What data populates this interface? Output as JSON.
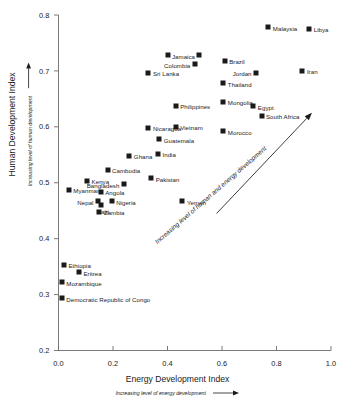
{
  "chart_data": {
    "type": "scatter",
    "title": "",
    "xlabel": "Energy Development Index",
    "xlabel_sub": "Increasing level of energy development",
    "ylabel": "Human Development Index",
    "ylabel_sub": "Increasing level of human development",
    "xlim": [
      0.0,
      1.0
    ],
    "ylim": [
      0.2,
      0.8
    ],
    "xticks": [
      "0.0",
      "0.2",
      "0.4",
      "0.6",
      "0.8",
      "1.0"
    ],
    "xtick_values": [
      0.0,
      0.2,
      0.4,
      0.6,
      0.8,
      1.0
    ],
    "yticks": [
      "0.2",
      "0.3",
      "0.4",
      "0.5",
      "0.6",
      "0.7",
      "0.8"
    ],
    "ytick_values": [
      0.2,
      0.3,
      0.4,
      0.5,
      0.6,
      0.7,
      0.8
    ],
    "grid": false,
    "legend": null,
    "marker_color": "#1a1a1a",
    "marker_shape": "square",
    "annotation": {
      "text": "Increasing level of human and energy development",
      "arrow": true,
      "arrow_from": [
        0.58,
        0.445
      ],
      "arrow_to": [
        0.93,
        0.625
      ]
    },
    "points": [
      {
        "label": "Libya",
        "x": 0.92,
        "y": 0.775,
        "label_side": "right"
      },
      {
        "label": "Malaysia",
        "x": 0.77,
        "y": 0.778,
        "label_side": "right"
      },
      {
        "label": "Jamaica",
        "x": 0.4,
        "y": 0.728,
        "label_side": "right"
      },
      {
        "label": "",
        "x": 0.515,
        "y": 0.728,
        "label_side": "none"
      },
      {
        "label": "Brazil",
        "x": 0.61,
        "y": 0.718,
        "label_side": "right"
      },
      {
        "label": "Colombia",
        "x": 0.5,
        "y": 0.712,
        "label_side": "left"
      },
      {
        "label": "Iran",
        "x": 0.895,
        "y": 0.7,
        "label_side": "right"
      },
      {
        "label": "Jordan",
        "x": 0.725,
        "y": 0.697,
        "label_side": "left"
      },
      {
        "label": "Sri Lanka",
        "x": 0.33,
        "y": 0.697,
        "label_side": "right"
      },
      {
        "label": "Thailand",
        "x": 0.605,
        "y": 0.678,
        "label_side": "right"
      },
      {
        "label": "Mongolia",
        "x": 0.605,
        "y": 0.645,
        "label_side": "right"
      },
      {
        "label": "Philippines",
        "x": 0.43,
        "y": 0.638,
        "label_side": "right"
      },
      {
        "label": "Egypt",
        "x": 0.715,
        "y": 0.637,
        "label_side": "right"
      },
      {
        "label": "South Africa",
        "x": 0.745,
        "y": 0.62,
        "label_side": "right"
      },
      {
        "label": "Vietnam",
        "x": 0.43,
        "y": 0.6,
        "label_side": "right"
      },
      {
        "label": "Nicaragua",
        "x": 0.33,
        "y": 0.598,
        "label_side": "right"
      },
      {
        "label": "Morocco",
        "x": 0.605,
        "y": 0.592,
        "label_side": "right"
      },
      {
        "label": "Guatemala",
        "x": 0.37,
        "y": 0.578,
        "label_side": "right"
      },
      {
        "label": "India",
        "x": 0.365,
        "y": 0.552,
        "label_side": "right"
      },
      {
        "label": "Ghana",
        "x": 0.26,
        "y": 0.548,
        "label_side": "right"
      },
      {
        "label": "Cambodia",
        "x": 0.18,
        "y": 0.523,
        "label_side": "right"
      },
      {
        "label": "Pakistan",
        "x": 0.34,
        "y": 0.508,
        "label_side": "right"
      },
      {
        "label": "Kenya",
        "x": 0.105,
        "y": 0.503,
        "label_side": "right"
      },
      {
        "label": "Bangladesh",
        "x": 0.24,
        "y": 0.497,
        "label_side": "left"
      },
      {
        "label": "Myanmar",
        "x": 0.038,
        "y": 0.487,
        "label_side": "right"
      },
      {
        "label": "Angola",
        "x": 0.155,
        "y": 0.484,
        "label_side": "right"
      },
      {
        "label": "Nigeria",
        "x": 0.195,
        "y": 0.467,
        "label_side": "right"
      },
      {
        "label": "Nepal",
        "x": 0.145,
        "y": 0.467,
        "label_side": "left"
      },
      {
        "label": "Haiti",
        "x": 0.155,
        "y": 0.461,
        "label_side": "none"
      },
      {
        "label": "Yemen",
        "x": 0.455,
        "y": 0.467,
        "label_side": "right"
      },
      {
        "label": "Zambia",
        "x": 0.15,
        "y": 0.448,
        "label_side": "right"
      },
      {
        "label": "Ethiopia",
        "x": 0.02,
        "y": 0.353,
        "label_side": "right"
      },
      {
        "label": "Eritrea",
        "x": 0.075,
        "y": 0.34,
        "label_side": "right"
      },
      {
        "label": "Mozambique",
        "x": 0.012,
        "y": 0.322,
        "label_side": "right"
      },
      {
        "label": "Democratic Republic of Congo",
        "x": 0.012,
        "y": 0.293,
        "label_side": "right"
      }
    ]
  }
}
